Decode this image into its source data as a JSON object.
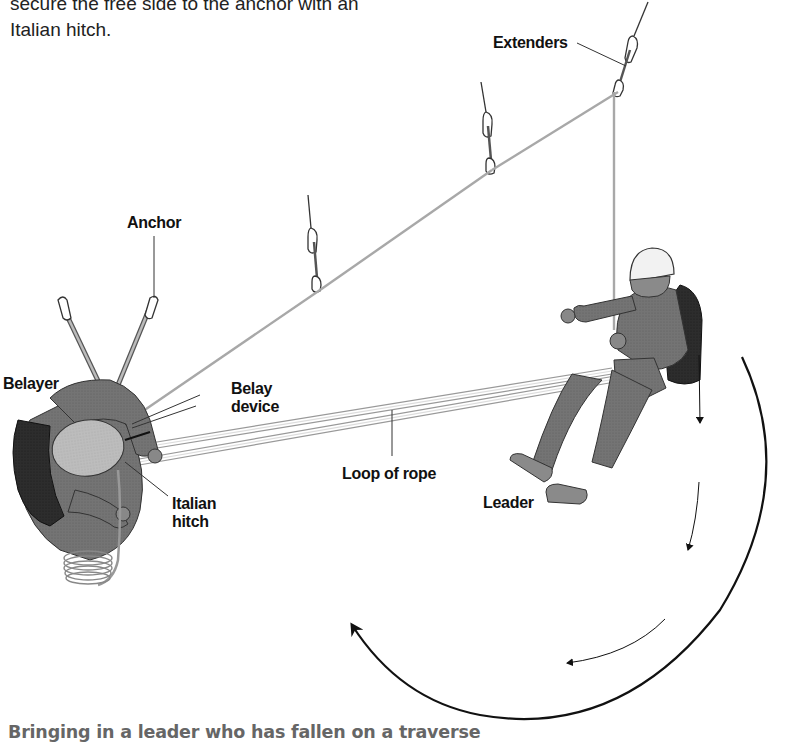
{
  "intro_text": {
    "line1": "secure the free side to the anchor with an",
    "line2": "Italian hitch."
  },
  "labels": {
    "extenders": "Extenders",
    "anchor": "Anchor",
    "belayer": "Belayer",
    "belay_device_line1": "Belay",
    "belay_device_line2": "device",
    "loop_of_rope": "Loop of rope",
    "italian_hitch_line1": "Italian",
    "italian_hitch_line2": "hitch",
    "leader": "Leader"
  },
  "caption": "Bringing in a leader who has fallen on a traverse",
  "colors": {
    "rope": "#b5b5b5",
    "clothing": "#6e6e6e",
    "backpack": "#2b2b2b",
    "helmet": "#f2f2f2",
    "arrow": "#111111",
    "caption": "#666666"
  }
}
